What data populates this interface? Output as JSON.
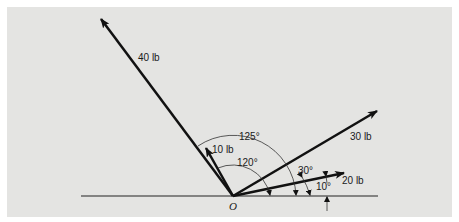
{
  "figure": {
    "origin_label": "O",
    "forces": [
      {
        "label": "40 lb",
        "angle": "125°"
      },
      {
        "label": "10 lb",
        "angle": "120°"
      },
      {
        "label": "30 lb",
        "angle": "30°"
      },
      {
        "label": "20 lb",
        "angle": "10°"
      }
    ],
    "angle_labels": {
      "a125": "125°",
      "a120": "120°",
      "a30": "30°",
      "a10": "10°"
    },
    "colors": {
      "panel": "#e4e4e2",
      "ink": "#111111"
    }
  }
}
